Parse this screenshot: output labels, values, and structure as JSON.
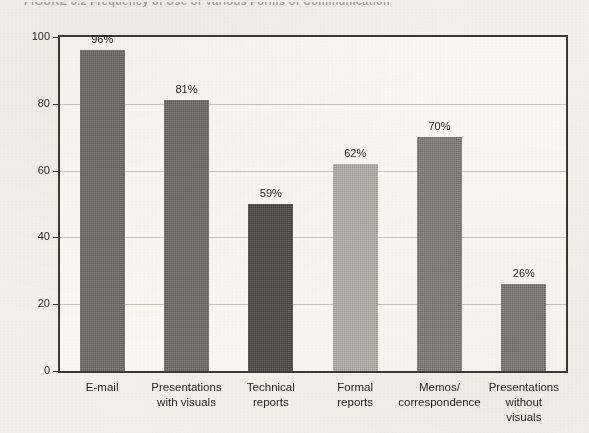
{
  "figure": {
    "title": "FIGURE 3.2  Frequency of Use of Various Forms of Communication"
  },
  "chart_data": {
    "type": "bar",
    "title": "",
    "xlabel": "",
    "ylabel": "",
    "ylim": [
      0,
      100
    ],
    "yticks": [
      "0",
      "20",
      "40",
      "60",
      "80",
      "100"
    ],
    "grid": true,
    "legend": "none",
    "categories": [
      "E-mail",
      "Presentations\nwith visuals",
      "Technical\nreports",
      "Formal\nreports",
      "Memos/\ncorrespondence",
      "Presentations\nwithout\nvisuals"
    ],
    "values": [
      96,
      81,
      59,
      62,
      70,
      26
    ],
    "drawn_heights": [
      96,
      81,
      50,
      62,
      70,
      26
    ],
    "data_labels": [
      "96%",
      "81%",
      "59%",
      "62%",
      "70%",
      "26%"
    ],
    "bar_colors": [
      "#6e6b66",
      "#6e6b66",
      "#4a4845",
      "#b7b4ae",
      "#807d77",
      "#7d7a74"
    ]
  },
  "colors": {
    "paper": "#f4f2ee",
    "plot_background": "#fbfaf7",
    "frame": "#3a3a38",
    "gridline": "#c9c6bf",
    "text": "#1f1f1f"
  }
}
